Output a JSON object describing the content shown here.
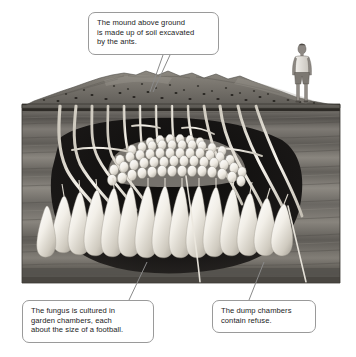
{
  "figure": {
    "type": "labelled-illustration-diagram",
    "background_color": "#ffffff",
    "illustration": {
      "name": "ant-nest-cutaway",
      "style": "grayscale pencil / airbrush illustration",
      "frame": {
        "x": 22,
        "y": 70,
        "width": 318,
        "height": 213
      },
      "ground_surface_y": 104,
      "elements": [
        {
          "name": "soil-mound",
          "label": "mound of excavated soil above ground",
          "color": "#7d7a74"
        },
        {
          "name": "nest-entrance-holes",
          "label": "dark entrance holes dotted across the mound",
          "count": 34,
          "color": "#2a2723"
        },
        {
          "name": "soil-strata",
          "label": "horizontal banded soil layers below ground",
          "color": "#6e6b66"
        },
        {
          "name": "tunnel-network",
          "label": "pale branching vertical tunnels from surface to chambers",
          "color": "#efece4"
        },
        {
          "name": "fungus-garden-dome",
          "label": "dome of clustered pale garden chambers",
          "color": "#f2efe7"
        },
        {
          "name": "dump-chambers",
          "label": "teardrop shaped pendant chambers below the dome",
          "color": "#f4f1ea"
        },
        {
          "name": "cavity-void",
          "label": "dark excavated cavity surrounding the nest",
          "color": "#171514"
        },
        {
          "name": "human-figure",
          "label": "person standing on the ground at right for scale",
          "color": "#8b8782"
        }
      ]
    }
  },
  "callouts": [
    {
      "id": "callout-mound",
      "name": "callout-mound",
      "lines": [
        "The mound above ground",
        "is made up of soil excavated",
        "by the ants."
      ],
      "leader": "points down-left to the soil mound"
    },
    {
      "id": "callout-fungus",
      "name": "callout-fungus",
      "lines": [
        "The fungus is cultured in",
        "garden chambers, each",
        "about the size of a football."
      ],
      "leader": "points up-right to the fungus garden dome"
    },
    {
      "id": "callout-dump",
      "name": "callout-dump",
      "lines": [
        "The dump chambers",
        "contain refuse."
      ],
      "leader": "points up-right to a dump chamber"
    }
  ],
  "colors": {
    "callout_border": "#9a9a9a",
    "callout_fill": "#ffffff",
    "text": "#1c1c1c",
    "leader_line": "#7f7f7f",
    "soil_light": "#9b978f",
    "soil_mid": "#6e6b66",
    "soil_dark": "#4a4744",
    "cavity": "#171514",
    "chamber_light": "#f6f3ec"
  }
}
